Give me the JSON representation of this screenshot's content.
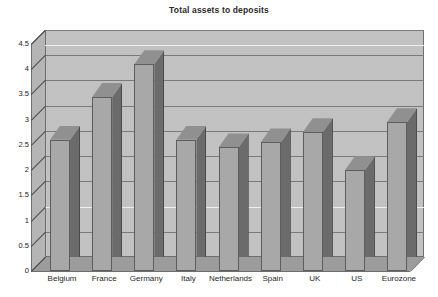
{
  "chart_data": {
    "type": "bar",
    "title": "Total assets to deposits",
    "xlabel": "",
    "ylabel": "",
    "categories": [
      "Belgium",
      "France",
      "Germany",
      "Italy",
      "Netherlands",
      "Spain",
      "UK",
      "US",
      "Eurozone"
    ],
    "values": [
      2.6,
      3.45,
      4.1,
      2.6,
      2.45,
      2.55,
      2.75,
      2.0,
      2.95
    ],
    "ylim": [
      0,
      4.5
    ],
    "ytick_step": 0.5,
    "yticks": [
      "0",
      "0.5",
      "1",
      "1.5",
      "2",
      "2.5",
      "3",
      "3.5",
      "4",
      "4.5"
    ],
    "grid": true,
    "legend": "none",
    "style": "3d-column-grayscale",
    "series": [
      {
        "name": "Total assets to deposits",
        "values": [
          2.6,
          3.45,
          4.1,
          2.6,
          2.45,
          2.55,
          2.75,
          2.0,
          2.95
        ]
      }
    ],
    "colors": {
      "bar_face": "#a8a8a8",
      "bar_side": "#6b6b6b",
      "bar_top": "#909090",
      "plot_background": "#c3c3c3",
      "floor": "#9c9c9c",
      "gridline": "#7a7a7a",
      "text": "#1f1f1f"
    }
  }
}
